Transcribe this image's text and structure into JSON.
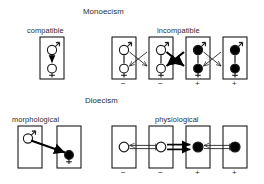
{
  "figure": {
    "type": "diagram",
    "sections": [
      {
        "id": "monoecism",
        "title": "Monoecism",
        "title_pos": {
          "x": 83,
          "y": 8
        },
        "groups": [
          {
            "id": "compatible",
            "label": "compatible",
            "label_pos": {
              "x": 27,
              "y": 27
            },
            "boxes": [
              {
                "id": "mono-compat-1",
                "x": 40,
                "y": 37,
                "w": 24,
                "h": 42,
                "sign": "",
                "symbols": [
                  {
                    "type": "male",
                    "fill": "open",
                    "cx": 52,
                    "cy": 48
                  },
                  {
                    "type": "female",
                    "fill": "open",
                    "cx": 52,
                    "cy": 69
                  }
                ],
                "selfing_arrow": true
              }
            ],
            "links": []
          },
          {
            "id": "incompatible",
            "label": "incompatible",
            "label_pos": {
              "x": 180,
              "y": 27
            },
            "boxes": [
              {
                "id": "mono-incompat-1",
                "x": 112,
                "y": 37,
                "w": 24,
                "h": 42,
                "sign": "−",
                "symbols": [
                  {
                    "type": "male",
                    "fill": "open",
                    "cx": 124,
                    "cy": 48
                  },
                  {
                    "type": "female",
                    "fill": "open",
                    "cx": 124,
                    "cy": 69
                  }
                ],
                "selfing_arrow": false
              },
              {
                "id": "mono-incompat-2",
                "x": 149,
                "y": 37,
                "w": 24,
                "h": 42,
                "sign": "−",
                "symbols": [
                  {
                    "type": "male",
                    "fill": "open",
                    "cx": 161,
                    "cy": 48
                  },
                  {
                    "type": "female",
                    "fill": "open",
                    "cx": 161,
                    "cy": 69
                  }
                ],
                "selfing_arrow": false
              },
              {
                "id": "mono-incompat-3",
                "x": 186,
                "y": 37,
                "w": 24,
                "h": 42,
                "sign": "+",
                "symbols": [
                  {
                    "type": "male",
                    "fill": "filled",
                    "cx": 198,
                    "cy": 48
                  },
                  {
                    "type": "female",
                    "fill": "filled",
                    "cx": 198,
                    "cy": 69
                  }
                ],
                "selfing_arrow": false
              },
              {
                "id": "mono-incompat-4",
                "x": 223,
                "y": 37,
                "w": 24,
                "h": 42,
                "sign": "+",
                "symbols": [
                  {
                    "type": "male",
                    "fill": "filled",
                    "cx": 235,
                    "cy": 48
                  },
                  {
                    "type": "female",
                    "fill": "filled",
                    "cx": 235,
                    "cy": 69
                  }
                ],
                "selfing_arrow": false
              }
            ],
            "links": [
              {
                "from": "mono-incompat-1",
                "to": "mono-incompat-2",
                "style": "thin",
                "crossed": true
              },
              {
                "from": "mono-incompat-2",
                "to": "mono-incompat-3",
                "style": "thick",
                "crossed": true
              },
              {
                "from": "mono-incompat-3",
                "to": "mono-incompat-4",
                "style": "thin",
                "crossed": true
              }
            ]
          }
        ]
      },
      {
        "id": "dioecism",
        "title": "Dioecism",
        "title_pos": {
          "x": 85,
          "y": 97
        },
        "groups": [
          {
            "id": "morphological",
            "label": "morphological",
            "label_pos": {
              "x": 14,
              "y": 116
            },
            "boxes": [
              {
                "id": "dio-morph-1",
                "x": 18,
                "y": 126,
                "w": 24,
                "h": 42,
                "sign": "",
                "symbols": [
                  {
                    "type": "male",
                    "fill": "open",
                    "cx": 30,
                    "cy": 138
                  }
                ],
                "selfing_arrow": false
              },
              {
                "id": "dio-morph-2",
                "x": 57,
                "y": 126,
                "w": 24,
                "h": 42,
                "sign": "",
                "symbols": [
                  {
                    "type": "female",
                    "fill": "filled",
                    "cx": 69,
                    "cy": 156
                  }
                ],
                "selfing_arrow": false
              }
            ],
            "links": [
              {
                "from": "dio-morph-1",
                "to": "dio-morph-2",
                "style": "thick-diagonal",
                "crossed": false
              }
            ]
          },
          {
            "id": "physiological",
            "label": "physiological",
            "label_pos": {
              "x": 178,
              "y": 116
            },
            "boxes": [
              {
                "id": "dio-phys-1",
                "x": 112,
                "y": 126,
                "w": 24,
                "h": 42,
                "sign": "−",
                "symbols": [
                  {
                    "type": "circle",
                    "fill": "open",
                    "cx": 124,
                    "cy": 147
                  }
                ],
                "selfing_arrow": false
              },
              {
                "id": "dio-phys-2",
                "x": 149,
                "y": 126,
                "w": 24,
                "h": 42,
                "sign": "−",
                "symbols": [
                  {
                    "type": "circle",
                    "fill": "open",
                    "cx": 161,
                    "cy": 147
                  }
                ],
                "selfing_arrow": false
              },
              {
                "id": "dio-phys-3",
                "x": 186,
                "y": 126,
                "w": 24,
                "h": 42,
                "sign": "+",
                "symbols": [
                  {
                    "type": "circle",
                    "fill": "filled",
                    "cx": 198,
                    "cy": 147
                  }
                ],
                "selfing_arrow": false
              },
              {
                "id": "dio-phys-4",
                "x": 223,
                "y": 126,
                "w": 24,
                "h": 42,
                "sign": "+",
                "symbols": [
                  {
                    "type": "circle",
                    "fill": "filled",
                    "cx": 235,
                    "cy": 147
                  }
                ],
                "selfing_arrow": false
              }
            ],
            "links": [
              {
                "from": "dio-phys-1",
                "to": "dio-phys-2",
                "style": "thin-blocked",
                "crossed": false
              },
              {
                "from": "dio-phys-2",
                "to": "dio-phys-3",
                "style": "thick-double",
                "crossed": false
              },
              {
                "from": "dio-phys-3",
                "to": "dio-phys-4",
                "style": "thin-blocked",
                "crossed": false
              }
            ]
          }
        ]
      }
    ],
    "signs": {
      "minus": "−",
      "plus": "+"
    },
    "colors": {
      "stroke": "#1a1a1a",
      "fill_open": "#ffffff",
      "fill_closed": "#000000",
      "background": "#ffffff",
      "text": "#2b2b2b"
    }
  }
}
